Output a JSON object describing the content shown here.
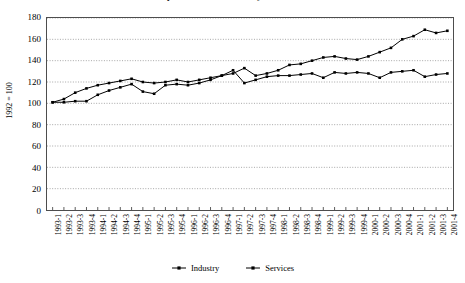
{
  "chart_data": {
    "type": "line",
    "title": "Output indices for industry and services",
    "ylabel": "1992 = 100",
    "xlabel": "",
    "ylim": [
      0,
      180
    ],
    "yticks": [
      0,
      20,
      40,
      60,
      80,
      100,
      120,
      140,
      160,
      180
    ],
    "grid": true,
    "grid_axis": "y",
    "legend_position": "bottom",
    "categories": [
      "1993-1",
      "1993-2",
      "1993-3",
      "1993-4",
      "1994-1",
      "1994-2",
      "1994-3",
      "1994-4",
      "1995-1",
      "1995-2",
      "1995-3",
      "1995-4",
      "1996-1",
      "1996-2",
      "1996-3",
      "1996-4",
      "1997-1",
      "1997-2",
      "1997-3",
      "1997-4",
      "1998-1",
      "1998-2",
      "1998-3",
      "1998-4",
      "1999-1",
      "1999-2",
      "1999-3",
      "1999-4",
      "2000-1",
      "2000-2",
      "2000-3",
      "2000-4",
      "2001-1",
      "2001-2",
      "2001-3",
      "2001-4"
    ],
    "series": [
      {
        "name": "Industry",
        "color": "#000000",
        "marker": "square",
        "values": [
          101,
          101,
          102,
          102,
          108,
          112,
          115,
          118,
          111,
          109,
          117,
          118,
          117,
          119,
          122,
          126,
          131,
          119,
          122,
          125,
          126,
          126,
          127,
          128,
          124,
          129,
          128,
          129,
          128,
          124,
          129,
          130,
          131,
          125,
          127,
          128
        ]
      },
      {
        "name": "Services",
        "color": "#000000",
        "marker": "square",
        "values": [
          101,
          104,
          110,
          114,
          117,
          119,
          121,
          123,
          120,
          119,
          120,
          122,
          120,
          122,
          124,
          126,
          128,
          133,
          126,
          128,
          131,
          136,
          137,
          140,
          143,
          144,
          142,
          141,
          144,
          148,
          152,
          160,
          163,
          169,
          166,
          168
        ]
      }
    ],
    "last_services_value": 171
  },
  "legend": {
    "items": [
      {
        "label": "Industry"
      },
      {
        "label": "Services"
      }
    ]
  }
}
